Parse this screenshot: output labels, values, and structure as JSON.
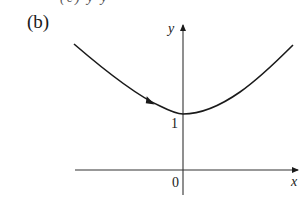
{
  "figure": {
    "panel_label": "(b)",
    "top_cutoff_text": "(c)  y          y",
    "axes": {
      "x_label": "x",
      "y_label": "y",
      "origin_label": "0",
      "y_intercept_label": "1"
    },
    "curve": {
      "description": "Convex curve decreasing from upper left to a minimum at (0,1) on the y-axis, then increasing to upper right; arrowhead on left branch pointing toward minimum",
      "minimum": {
        "x": 0,
        "y": 1
      },
      "direction_arrow": "along left branch toward minimum"
    },
    "colors": {
      "line": "#1a1a1a",
      "background": "#ffffff"
    }
  }
}
